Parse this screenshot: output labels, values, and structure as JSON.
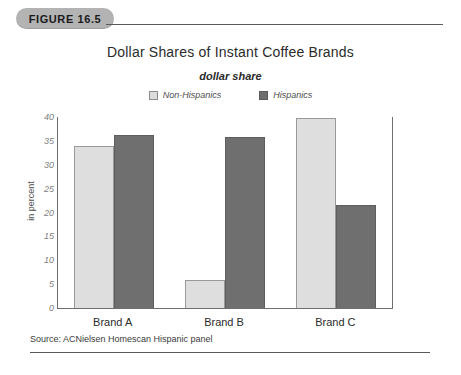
{
  "figure": {
    "badge_label": "FIGURE 16.5"
  },
  "chart_data": {
    "type": "bar",
    "title": "Dollar Shares of Instant Coffee Brands",
    "subtitle": "dollar share",
    "xlabel": "",
    "ylabel": "in percent",
    "ylim": [
      0,
      40
    ],
    "ytick_step": 5,
    "yticks": [
      "40",
      "35",
      "30",
      "25",
      "20",
      "15",
      "10",
      "5",
      "0"
    ],
    "categories": [
      "Brand A",
      "Brand B",
      "Brand C"
    ],
    "series": [
      {
        "name": "Non-Hispanics",
        "values": [
          33.8,
          5.6,
          39.6
        ],
        "color": "#dedede"
      },
      {
        "name": "Hispanics",
        "values": [
          36.0,
          35.6,
          21.4
        ],
        "color": "#6f6f6f"
      }
    ],
    "legend_position": "top-center",
    "grid": false
  },
  "source": {
    "text": "Source: ACNielsen Homescan Hispanic panel"
  }
}
